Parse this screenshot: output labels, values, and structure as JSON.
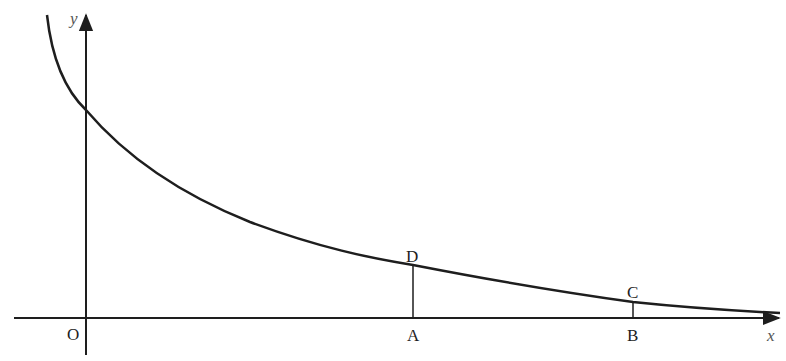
{
  "diagram": {
    "type": "function-graph",
    "colors": {
      "stroke": "#1e1e1e",
      "axis_label": "#555555",
      "background": "#ffffff"
    },
    "axes": {
      "x_label": "x",
      "y_label": "y",
      "origin_label": "O"
    },
    "points": {
      "A": {
        "label": "A",
        "on": "x-axis"
      },
      "B": {
        "label": "B",
        "on": "x-axis"
      },
      "C": {
        "label": "C",
        "on": "curve",
        "above": "B"
      },
      "D": {
        "label": "D",
        "on": "curve",
        "above": "A"
      }
    },
    "segments": [
      {
        "from": "A",
        "to": "D"
      },
      {
        "from": "B",
        "to": "C"
      }
    ]
  }
}
